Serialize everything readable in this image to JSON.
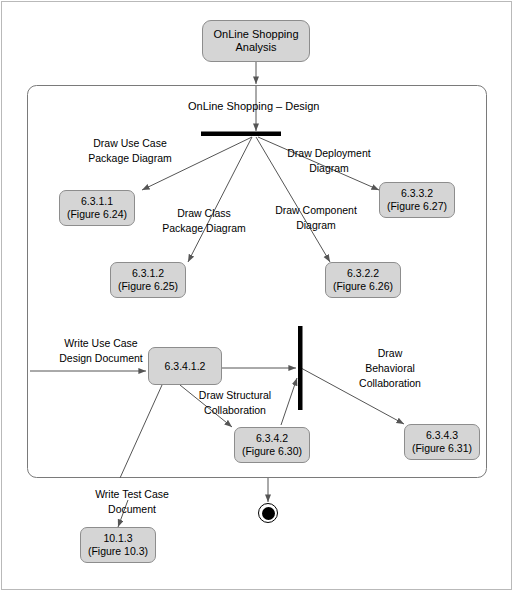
{
  "diagram": {
    "type": "uml-activity-diagram",
    "start_node": {
      "line1": "OnLine Shopping",
      "line2": "Analysis"
    },
    "frame_title": "OnLine Shopping – Design",
    "nodes": [
      {
        "id": "n_6311",
        "line1": "6.3.1.1",
        "line2": "(Figure 6.24)"
      },
      {
        "id": "n_6312",
        "line1": "6.3.1.2",
        "line2": "(Figure 6.25)"
      },
      {
        "id": "n_6322",
        "line1": "6.3.2.2",
        "line2": "(Figure 6.26)"
      },
      {
        "id": "n_6332",
        "line1": "6.3.3.2",
        "line2": "(Figure 6.27)"
      },
      {
        "id": "n_63412",
        "line1": "6.3.4.1.2",
        "line2": ""
      },
      {
        "id": "n_6342",
        "line1": "6.3.4.2",
        "line2": "(Figure 6.30)"
      },
      {
        "id": "n_6343",
        "line1": "6.3.4.3",
        "line2": "(Figure 6.31)"
      },
      {
        "id": "n_1013",
        "line1": "10.1.3",
        "line2": "(Figure 10.3)"
      }
    ],
    "edge_labels": [
      {
        "id": "l_usecase_pkg",
        "line1": "Draw Use Case",
        "line2": "Package Diagram"
      },
      {
        "id": "l_class_pkg",
        "line1": "Draw Class",
        "line2": "Package Diagram"
      },
      {
        "id": "l_component",
        "line1": "Draw Component",
        "line2": "Diagram"
      },
      {
        "id": "l_deployment",
        "line1": "Draw Deployment",
        "line2": "Diagram"
      },
      {
        "id": "l_write_usecase",
        "line1": "Write Use Case",
        "line2": "Design Document"
      },
      {
        "id": "l_structural",
        "line1": "Draw Structural",
        "line2": "Collaboration"
      },
      {
        "id": "l_behavioral",
        "line1": "Draw",
        "line2": "Behavioral",
        "line3": "Collaboration"
      },
      {
        "id": "l_write_testcase",
        "line1": "Write Test Case",
        "line2": "Document"
      }
    ],
    "colors": {
      "node_fill": "#d5d5d5",
      "node_border": "#8d8d8d",
      "edge": "#555555",
      "bar": "#000000",
      "frame_border": "#7a7a7a",
      "page_border": "#b9b9b9",
      "text": "#000000"
    }
  }
}
